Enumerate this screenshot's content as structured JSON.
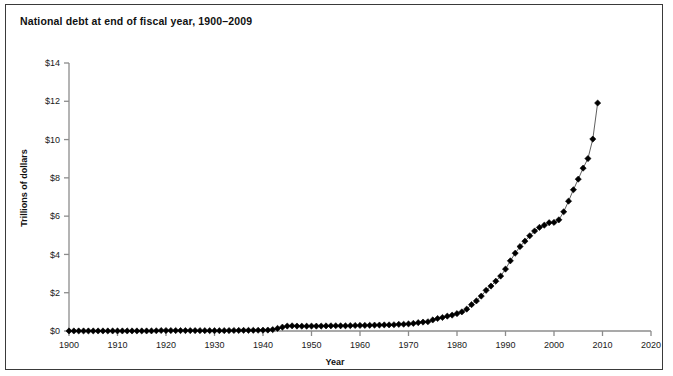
{
  "figure": {
    "title": "National debt at end of fiscal year, 1900–2009",
    "background_color": "#ffffff",
    "border_color": "#3a3a3a"
  },
  "axes": {
    "x_title": "Year",
    "y_title": "Trillions of dollars",
    "x_ticks": [
      "1900",
      "1910",
      "1920",
      "1930",
      "1940",
      "1950",
      "1960",
      "1970",
      "1980",
      "1990",
      "2000",
      "2010",
      "2020"
    ],
    "y_ticks": [
      "$0",
      "$2",
      "$4",
      "$6",
      "$8",
      "$10",
      "$12",
      "$14"
    ],
    "axis_color": "#8c8c8c",
    "tick_label_color": "#1a1a1a"
  },
  "chart_data": {
    "type": "line",
    "title": "National debt at end of fiscal year, 1900–2009",
    "xlabel": "Year",
    "ylabel": "Trillions of dollars",
    "xlim": [
      1900,
      2020
    ],
    "ylim": [
      0,
      14
    ],
    "xtick_step": 10,
    "ytick_step": 2,
    "grid": false,
    "legend": false,
    "marker": "diamond",
    "marker_color": "#000000",
    "line_color": "#4d4d4d",
    "series_name": "National debt",
    "x": [
      1900,
      1901,
      1902,
      1903,
      1904,
      1905,
      1906,
      1907,
      1908,
      1909,
      1910,
      1911,
      1912,
      1913,
      1914,
      1915,
      1916,
      1917,
      1918,
      1919,
      1920,
      1921,
      1922,
      1923,
      1924,
      1925,
      1926,
      1927,
      1928,
      1929,
      1930,
      1931,
      1932,
      1933,
      1934,
      1935,
      1936,
      1937,
      1938,
      1939,
      1940,
      1941,
      1942,
      1943,
      1944,
      1945,
      1946,
      1947,
      1948,
      1949,
      1950,
      1951,
      1952,
      1953,
      1954,
      1955,
      1956,
      1957,
      1958,
      1959,
      1960,
      1961,
      1962,
      1963,
      1964,
      1965,
      1966,
      1967,
      1968,
      1969,
      1970,
      1971,
      1972,
      1973,
      1974,
      1975,
      1976,
      1977,
      1978,
      1979,
      1980,
      1981,
      1982,
      1983,
      1984,
      1985,
      1986,
      1987,
      1988,
      1989,
      1990,
      1991,
      1992,
      1993,
      1994,
      1995,
      1996,
      1997,
      1998,
      1999,
      2000,
      2001,
      2002,
      2003,
      2004,
      2005,
      2006,
      2007,
      2008,
      2009
    ],
    "values": [
      0.0021,
      0.0022,
      0.0022,
      0.0023,
      0.0023,
      0.0023,
      0.0023,
      0.0023,
      0.0024,
      0.0027,
      0.0027,
      0.0027,
      0.0027,
      0.0027,
      0.0028,
      0.0031,
      0.0033,
      0.006,
      0.0124,
      0.0255,
      0.0243,
      0.024,
      0.0229,
      0.0225,
      0.0212,
      0.0207,
      0.0198,
      0.0188,
      0.0177,
      0.0167,
      0.0162,
      0.0168,
      0.0193,
      0.0226,
      0.027,
      0.0285,
      0.0336,
      0.0364,
      0.0371,
      0.0403,
      0.0429,
      0.049,
      0.0722,
      0.1368,
      0.2013,
      0.2588,
      0.2694,
      0.258,
      0.2524,
      0.2527,
      0.2567,
      0.2551,
      0.2592,
      0.2661,
      0.2712,
      0.2742,
      0.2727,
      0.2722,
      0.2798,
      0.2876,
      0.2906,
      0.2928,
      0.298,
      0.3059,
      0.3117,
      0.3173,
      0.3196,
      0.3264,
      0.3478,
      0.3537,
      0.3709,
      0.3981,
      0.4357,
      0.466,
      0.4835,
      0.5765,
      0.6535,
      0.7063,
      0.7766,
      0.8295,
      0.9079,
      0.9979,
      1.1421,
      1.3771,
      1.5721,
      1.8233,
      2.1252,
      2.3462,
      2.6013,
      2.8677,
      3.2331,
      3.6653,
      4.0648,
      4.4114,
      4.6927,
      4.974,
      5.2247,
      5.4132,
      5.5261,
      5.6562,
      5.6743,
      5.8072,
      6.2282,
      6.7831,
      7.3794,
      7.9328,
      8.507,
      9.0079,
      10.0248,
      11.9099
    ],
    "annotations": []
  }
}
